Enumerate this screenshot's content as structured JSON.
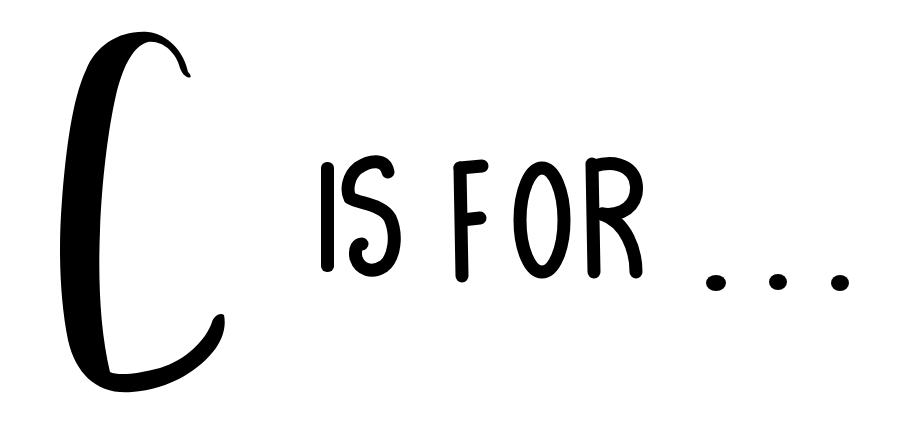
{
  "artwork": {
    "text": "C IS FOR ...",
    "big_letter": "C",
    "words": [
      "IS",
      "FOR"
    ],
    "ellipsis": "...",
    "ink_color": "#000000",
    "background_color": "#ffffff"
  }
}
